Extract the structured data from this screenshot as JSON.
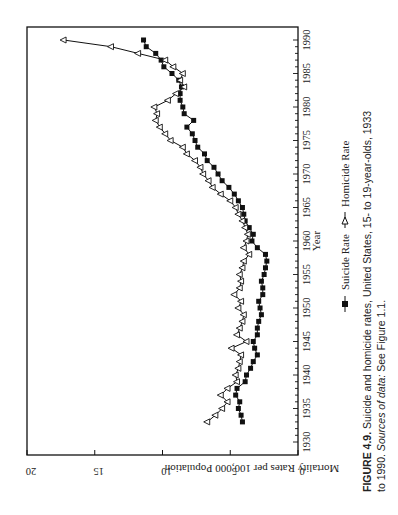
{
  "figure": {
    "label": "FIGURE 4.9.",
    "caption_line1": " Suicide and homicide rates, United States, 15- to 19-year-olds, 1933",
    "caption_line2_prefix": "to 1990. ",
    "caption_line2_italic": "Sources of data:",
    "caption_line2_suffix": " See Figure 1.1."
  },
  "legend": {
    "suicide": "Suicide Rate",
    "homicide": "Homicide Rate"
  },
  "chart_data": {
    "type": "line",
    "orientation_note": "page rotated 90 degrees counter-clockwise",
    "title": "",
    "xlabel": "Year",
    "ylabel": "Mortality Rates per 100,000 Population",
    "xlim": [
      1930,
      1990
    ],
    "ylim": [
      0,
      20
    ],
    "x_ticks": [
      "1930",
      "1935",
      "1940",
      "1945",
      "1950",
      "1955",
      "1960",
      "1965",
      "1970",
      "1975",
      "1980",
      "1985",
      "1990"
    ],
    "y_ticks": [
      "0",
      "5",
      "10",
      "15",
      "20"
    ],
    "grid": false,
    "legend_position": "bottom",
    "x": [
      1933,
      1934,
      1935,
      1936,
      1937,
      1938,
      1939,
      1940,
      1941,
      1942,
      1943,
      1944,
      1945,
      1946,
      1947,
      1948,
      1949,
      1950,
      1951,
      1952,
      1953,
      1954,
      1955,
      1956,
      1957,
      1958,
      1959,
      1960,
      1961,
      1962,
      1963,
      1964,
      1965,
      1966,
      1967,
      1968,
      1969,
      1970,
      1971,
      1972,
      1973,
      1974,
      1975,
      1976,
      1977,
      1978,
      1979,
      1980,
      1981,
      1982,
      1983,
      1984,
      1985,
      1986,
      1987,
      1988,
      1989,
      1990
    ],
    "series": [
      {
        "name": "Suicide Rate",
        "marker": "filled-square",
        "values": [
          4.1,
          4.2,
          4.4,
          4.3,
          4.6,
          4.5,
          3.9,
          3.8,
          3.5,
          3.3,
          3.0,
          3.2,
          3.3,
          3.0,
          3.0,
          2.9,
          2.7,
          2.8,
          2.9,
          2.6,
          2.6,
          2.7,
          2.5,
          2.4,
          2.3,
          2.4,
          3.0,
          3.4,
          3.3,
          3.6,
          3.9,
          4.0,
          4.1,
          4.4,
          4.7,
          5.1,
          5.6,
          5.9,
          6.2,
          6.7,
          6.9,
          7.4,
          7.6,
          7.8,
          8.2,
          7.7,
          8.4,
          8.5,
          8.7,
          8.7,
          8.6,
          8.8,
          9.3,
          9.9,
          10.1,
          10.5,
          11.2,
          11.4
        ]
      },
      {
        "name": "Homicide Rate",
        "marker": "open-triangle",
        "values": [
          6.7,
          6.1,
          5.6,
          5.2,
          5.7,
          5.2,
          4.5,
          4.6,
          4.4,
          4.3,
          4.2,
          4.9,
          3.8,
          4.5,
          4.3,
          4.1,
          4.0,
          4.4,
          4.2,
          4.7,
          4.3,
          4.2,
          4.3,
          4.1,
          4.0,
          3.6,
          4.0,
          3.8,
          3.7,
          3.9,
          4.1,
          4.4,
          4.6,
          5.0,
          5.7,
          6.3,
          6.6,
          7.0,
          7.2,
          7.6,
          8.2,
          8.5,
          9.4,
          9.8,
          10.2,
          10.5,
          10.4,
          10.6,
          9.6,
          9.0,
          8.4,
          8.7,
          8.5,
          9.2,
          9.8,
          11.8,
          13.8,
          17.3
        ]
      }
    ]
  }
}
